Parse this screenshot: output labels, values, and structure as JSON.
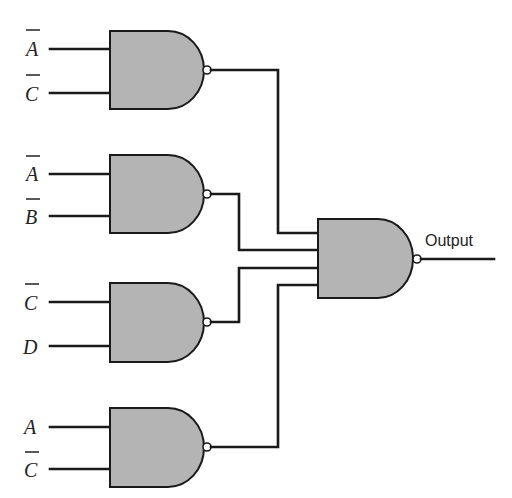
{
  "diagram": {
    "type": "logic-circuit",
    "gates": [
      {
        "id": "g1",
        "type": "NAND",
        "inputs": [
          {
            "label": "A",
            "inverted": true
          },
          {
            "label": "C",
            "inverted": true
          }
        ]
      },
      {
        "id": "g2",
        "type": "NAND",
        "inputs": [
          {
            "label": "A",
            "inverted": true
          },
          {
            "label": "B",
            "inverted": true
          }
        ]
      },
      {
        "id": "g3",
        "type": "NAND",
        "inputs": [
          {
            "label": "C",
            "inverted": true
          },
          {
            "label": "D",
            "inverted": false
          }
        ]
      },
      {
        "id": "g4",
        "type": "NAND",
        "inputs": [
          {
            "label": "A",
            "inverted": false
          },
          {
            "label": "C",
            "inverted": true
          }
        ]
      },
      {
        "id": "g5",
        "type": "NAND",
        "inputs": [
          "g1",
          "g2",
          "g3",
          "g4"
        ],
        "output_label": "Output"
      }
    ],
    "labels": {
      "g1_in1": "A",
      "g1_in2": "C",
      "g2_in1": "A",
      "g2_in2": "B",
      "g3_in1": "C",
      "g3_in2": "D",
      "g4_in1": "A",
      "g4_in2": "C",
      "output": "Output"
    },
    "colors": {
      "gate_fill": "#b4b4b4",
      "line": "#1a1a1a",
      "background": "#ffffff"
    }
  }
}
